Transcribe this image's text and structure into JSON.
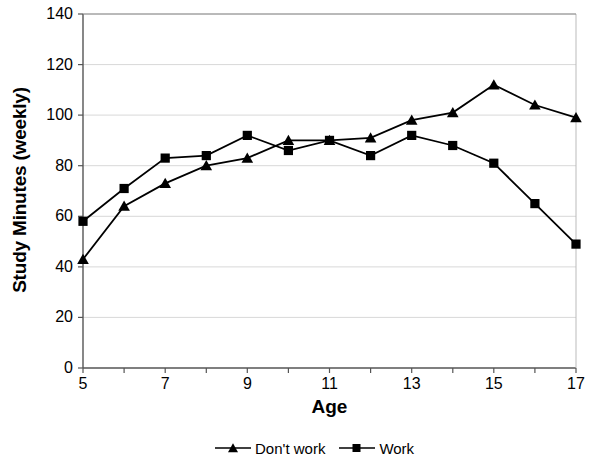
{
  "chart_data": {
    "type": "line",
    "title": "",
    "xlabel": "Age",
    "ylabel": "Study Minutes (weekly)",
    "x": [
      5,
      6,
      7,
      8,
      9,
      10,
      11,
      12,
      13,
      14,
      15,
      16,
      17
    ],
    "xlim": [
      5,
      17
    ],
    "ylim": [
      0,
      140
    ],
    "xticks": [
      5,
      6,
      7,
      8,
      9,
      10,
      11,
      12,
      13,
      14,
      15,
      16,
      17
    ],
    "xtick_labels": [
      "5",
      "",
      "7",
      "",
      "9",
      "",
      "11",
      "",
      "13",
      "",
      "15",
      "",
      "17"
    ],
    "yticks": [
      0,
      20,
      40,
      60,
      80,
      100,
      120,
      140
    ],
    "ytick_labels": [
      "0",
      "20",
      "40",
      "60",
      "80",
      "100",
      "120",
      "140"
    ],
    "grid": "horizontal",
    "legend_position": "bottom-center",
    "series": [
      {
        "name": "Don't work",
        "marker": "triangle",
        "color": "#000000",
        "values": [
          43,
          64,
          73,
          80,
          83,
          90,
          90,
          91,
          98,
          101,
          112,
          104,
          99
        ]
      },
      {
        "name": "Work",
        "marker": "square",
        "color": "#000000",
        "values": [
          58,
          71,
          83,
          84,
          92,
          86,
          90,
          84,
          92,
          88,
          81,
          65,
          49
        ]
      }
    ]
  },
  "legend": {
    "items": [
      {
        "label": "Don't work",
        "marker": "triangle-marker"
      },
      {
        "label": "Work",
        "marker": "square-marker"
      }
    ]
  },
  "axes": {
    "x_title": "Age",
    "y_title": "Study Minutes (weekly)"
  }
}
